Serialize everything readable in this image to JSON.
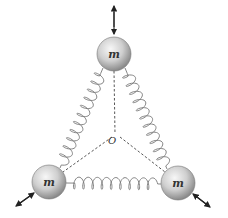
{
  "diagram": {
    "center_label": "O",
    "masses": [
      {
        "id": "top",
        "label": "m",
        "cx": 114,
        "cy": 54
      },
      {
        "id": "bottom-left",
        "label": "m",
        "cx": 49,
        "cy": 182
      },
      {
        "id": "bottom-right",
        "label": "m",
        "cx": 178,
        "cy": 183
      }
    ],
    "mass_radius": 17,
    "springs": [
      {
        "from": "top",
        "to": "bottom-left"
      },
      {
        "from": "top",
        "to": "bottom-right"
      },
      {
        "from": "bottom-left",
        "to": "bottom-right"
      }
    ],
    "oscillation_arrows": [
      "top: vertical double arrow",
      "bottom-left: diagonal double arrow",
      "bottom-right: diagonal double arrow"
    ],
    "colors": {
      "mass_light": "#f2f2f2",
      "mass_dark": "#8c8c8c",
      "spring": "#777777",
      "dashed": "#444444",
      "arrow": "#222222"
    }
  }
}
